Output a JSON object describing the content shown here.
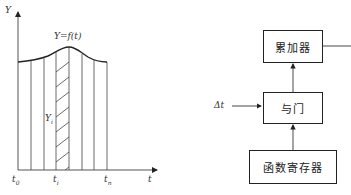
{
  "left_figure": {
    "y_axis_label": "Y",
    "x_axis_label": "t",
    "curve_label": "Y=f(t)",
    "strip_label": "Y",
    "strip_label_sub": "i",
    "ticks": [
      {
        "main": "t",
        "sub": "0"
      },
      {
        "main": "t",
        "sub": "i"
      },
      {
        "main": "t",
        "sub": "n"
      }
    ]
  },
  "right_figure": {
    "blocks": {
      "accumulator": "累加器",
      "and_gate": "与门",
      "function_register": "函数寄存器"
    },
    "input_label": "Δt"
  },
  "colors": {
    "line": "#222222",
    "axis": "#555555",
    "background": "#ffffff"
  }
}
